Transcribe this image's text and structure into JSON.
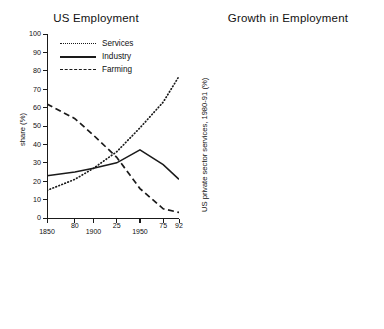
{
  "figure": {
    "width": 384,
    "height": 329,
    "background": "#ffffff",
    "ink": "#1a1a1a",
    "bar_fill": "#9a9a9a"
  },
  "chart_data": [
    {
      "type": "line",
      "title": "US Employment",
      "xlabel": "",
      "ylabel": "share (%)",
      "ylim": [
        0,
        100
      ],
      "yticks": [
        0,
        10,
        20,
        30,
        40,
        50,
        60,
        70,
        80,
        90,
        100
      ],
      "xlim": [
        1850,
        1992
      ],
      "xticks": [
        1850,
        1880,
        1900,
        1925,
        1950,
        1975,
        1992
      ],
      "xtick_labels": [
        "1850",
        "80",
        "1900",
        "25",
        "1950",
        "75",
        "92"
      ],
      "grid": false,
      "legend_position": "top-center",
      "series": [
        {
          "name": "Services",
          "style": "dotted",
          "x": [
            1850,
            1880,
            1900,
            1925,
            1950,
            1975,
            1992
          ],
          "values": [
            15,
            21,
            27,
            36,
            49,
            63,
            77
          ]
        },
        {
          "name": "Industry",
          "style": "solid",
          "x": [
            1850,
            1880,
            1900,
            1925,
            1950,
            1975,
            1992
          ],
          "values": [
            23,
            25,
            27,
            30,
            37,
            29,
            21
          ]
        },
        {
          "name": "Farming",
          "style": "dashed",
          "x": [
            1850,
            1880,
            1900,
            1925,
            1950,
            1975,
            1992
          ],
          "values": [
            62,
            54,
            45,
            33,
            16,
            5,
            3
          ]
        }
      ]
    },
    {
      "type": "bar",
      "title": "Growth in Employment",
      "xlabel": "",
      "ylabel": "US private sector services, 1980-91 (%)",
      "ylim": [
        0,
        105
      ],
      "yticks": [
        0,
        10,
        20,
        30,
        40,
        50,
        60,
        70,
        80,
        90,
        100
      ],
      "grid": false,
      "categories": [
        "Legal Services",
        "Business Services",
        "Health",
        "Recreation",
        "Hotels",
        "Education",
        "Retail Trade",
        "Financial Services",
        "Wholesale Trade",
        "Transport & Communications"
      ],
      "values": [
        105,
        66,
        57.5,
        52.5,
        51.5,
        35,
        31.5,
        28.5,
        15.5,
        11
      ]
    }
  ]
}
